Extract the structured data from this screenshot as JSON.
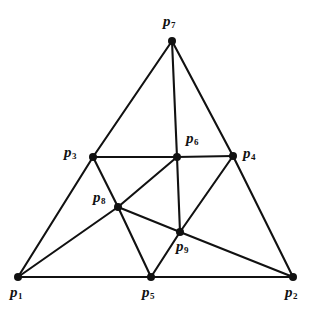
{
  "figure": {
    "background_color": "#ffffff",
    "line_color": "#111111",
    "vertex_color": "#111111",
    "width": 316,
    "height": 319
  },
  "chart_data": {
    "type": "scatter",
    "title": "",
    "xlabel": "",
    "ylabel": "",
    "grid": false,
    "legend": false,
    "xlim": [
      0,
      316
    ],
    "ylim": [
      0,
      319
    ],
    "nodes": [
      {
        "id": "p1",
        "label": "p",
        "sub": "1",
        "x": 18,
        "y": 277,
        "label_x": 10,
        "label_y": 285,
        "r": 4.0
      },
      {
        "id": "p2",
        "label": "p",
        "sub": "2",
        "x": 293,
        "y": 277,
        "label_x": 285,
        "label_y": 285,
        "r": 4.0
      },
      {
        "id": "p3",
        "label": "p",
        "sub": "3",
        "x": 93,
        "y": 157,
        "label_x": 64,
        "label_y": 145,
        "r": 4.0
      },
      {
        "id": "p4",
        "label": "p",
        "sub": "4",
        "x": 233,
        "y": 156,
        "label_x": 243,
        "label_y": 146,
        "r": 4.0
      },
      {
        "id": "p5",
        "label": "p",
        "sub": "5",
        "x": 151,
        "y": 277,
        "label_x": 142,
        "label_y": 285,
        "r": 4.0
      },
      {
        "id": "p6",
        "label": "p",
        "sub": "6",
        "x": 177,
        "y": 157,
        "label_x": 186,
        "label_y": 131,
        "r": 4.0
      },
      {
        "id": "p7",
        "label": "p",
        "sub": "7",
        "x": 172,
        "y": 41,
        "label_x": 163,
        "label_y": 14,
        "r": 4.0
      },
      {
        "id": "p8",
        "label": "p",
        "sub": "8",
        "x": 118,
        "y": 207,
        "label_x": 93,
        "label_y": 190,
        "r": 4.0
      },
      {
        "id": "p9",
        "label": "p",
        "sub": "9",
        "x": 180,
        "y": 232,
        "label_x": 176,
        "label_y": 239,
        "r": 4.0
      }
    ],
    "edges": [
      {
        "from": "p1",
        "to": "p2"
      },
      {
        "from": "p1",
        "to": "p3"
      },
      {
        "from": "p1",
        "to": "p8"
      },
      {
        "from": "p3",
        "to": "p7"
      },
      {
        "from": "p3",
        "to": "p6"
      },
      {
        "from": "p3",
        "to": "p8"
      },
      {
        "from": "p7",
        "to": "p6"
      },
      {
        "from": "p7",
        "to": "p4"
      },
      {
        "from": "p6",
        "to": "p4"
      },
      {
        "from": "p6",
        "to": "p8"
      },
      {
        "from": "p6",
        "to": "p9"
      },
      {
        "from": "p4",
        "to": "p9"
      },
      {
        "from": "p4",
        "to": "p2"
      },
      {
        "from": "p8",
        "to": "p5"
      },
      {
        "from": "p8",
        "to": "p9"
      },
      {
        "from": "p9",
        "to": "p5"
      },
      {
        "from": "p9",
        "to": "p2"
      }
    ]
  }
}
